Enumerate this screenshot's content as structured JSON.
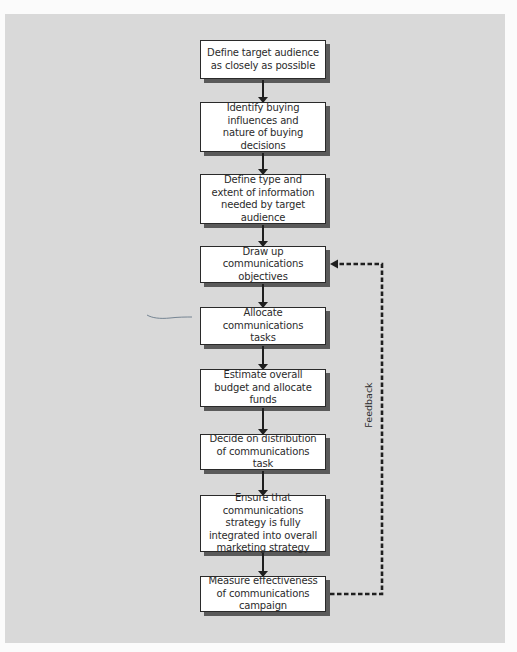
{
  "diagram": {
    "type": "flowchart",
    "direction": "top-to-bottom",
    "steps": [
      {
        "id": 1,
        "label": "Define target audience as closely as possible"
      },
      {
        "id": 2,
        "label": "Identify buying influences and nature of buying decisions"
      },
      {
        "id": 3,
        "label": "Define type and extent of information needed by target audience"
      },
      {
        "id": 4,
        "label": "Draw up communications objectives"
      },
      {
        "id": 5,
        "label": "Allocate communications tasks"
      },
      {
        "id": 6,
        "label": "Estimate overall budget and allocate funds"
      },
      {
        "id": 7,
        "label": "Decide on distribution of communications task"
      },
      {
        "id": 8,
        "label": "Ensure that communications strategy is fully integrated into overall marketing strategy"
      },
      {
        "id": 9,
        "label": "Measure effectiveness of communications campaign"
      }
    ],
    "feedback": {
      "label": "Feedback",
      "from_step": 9,
      "to_step": 4,
      "style": "dashed"
    },
    "colors": {
      "panel_background": "#d9d9d9",
      "page_background": "#fbfbfb",
      "box_fill": "#ffffff",
      "box_border": "#2a2a2a",
      "box_shadow": "#5a5a5a",
      "arrow": "#1f1f1f",
      "scribble": "#6a7a8a"
    }
  }
}
